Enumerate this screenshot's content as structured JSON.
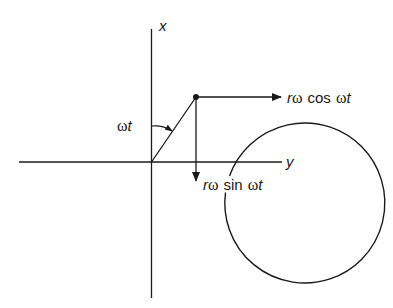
{
  "diagram": {
    "axes": {
      "vertical_label": "x",
      "horizontal_label": "y"
    },
    "angle_label": {
      "omega": "ω",
      "t": "t"
    },
    "cos_component": {
      "r": "r",
      "omega": "ω",
      "func": "cos",
      "omega2": "ω",
      "t": "t"
    },
    "sin_component": {
      "r": "r",
      "omega": "ω",
      "func": "sin",
      "omega2": "ω",
      "t": "t"
    },
    "colors": {
      "stroke": "#1a1a1a",
      "background": "#ffffff"
    }
  }
}
